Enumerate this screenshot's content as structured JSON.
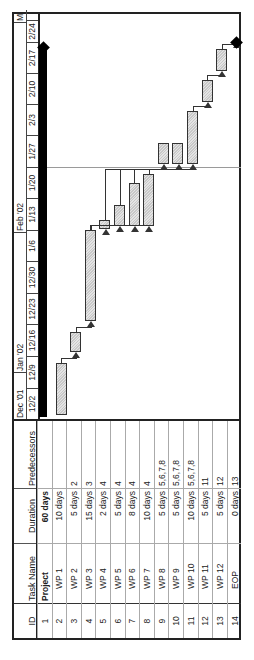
{
  "table": {
    "headers": {
      "id": "ID",
      "task_name": "Task Name",
      "duration": "Duration",
      "predecessors": "Predecessors"
    },
    "rows": [
      {
        "id": "1",
        "name": "Project",
        "duration": "60 days",
        "predecessors": "",
        "summary": true
      },
      {
        "id": "2",
        "name": "WP 1",
        "duration": "10 days",
        "predecessors": ""
      },
      {
        "id": "3",
        "name": "WP 2",
        "duration": "5 days",
        "predecessors": "2"
      },
      {
        "id": "4",
        "name": "WP 3",
        "duration": "15 days",
        "predecessors": "3"
      },
      {
        "id": "5",
        "name": "WP 4",
        "duration": "2 days",
        "predecessors": "4"
      },
      {
        "id": "6",
        "name": "WP 5",
        "duration": "5 days",
        "predecessors": "4"
      },
      {
        "id": "7",
        "name": "WP 6",
        "duration": "8 days",
        "predecessors": "4"
      },
      {
        "id": "8",
        "name": "WP 7",
        "duration": "10 days",
        "predecessors": "4"
      },
      {
        "id": "9",
        "name": "WP 8",
        "duration": "5 days",
        "predecessors": "5,6,7,8"
      },
      {
        "id": "10",
        "name": "WP 9",
        "duration": "5 days",
        "predecessors": "5,6,7,8"
      },
      {
        "id": "11",
        "name": "WP 10",
        "duration": "10 days",
        "predecessors": "5,6,7,8"
      },
      {
        "id": "12",
        "name": "WP 11",
        "duration": "5 days",
        "predecessors": "11"
      },
      {
        "id": "13",
        "name": "WP 12",
        "duration": "5 days",
        "predecessors": "12"
      },
      {
        "id": "14",
        "name": "EOP",
        "duration": "0 days",
        "predecessors": "13"
      }
    ]
  },
  "timescale": {
    "months": [
      {
        "label": "Dec '01"
      },
      {
        "label": "Jan '02"
      },
      {
        "label": "Feb '02"
      },
      {
        "label": "M"
      }
    ],
    "weeks": [
      "12/2",
      "12/9",
      "12/16",
      "12/23",
      "12/30",
      "1/6",
      "1/13",
      "1/20",
      "1/27",
      "2/3",
      "2/10",
      "2/17",
      "2/24"
    ]
  },
  "colors": {
    "border": "#222222",
    "bar_fill": "#d4d4d4",
    "summary": "#000000",
    "gridline": "#9a9a9a"
  }
}
